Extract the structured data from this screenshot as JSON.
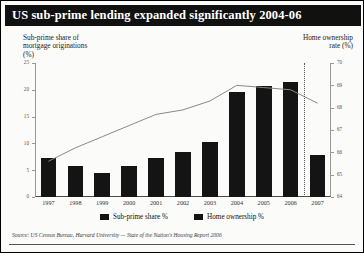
{
  "title": "US sub-prime lending expanded significantly 2004-06",
  "left_axis_caption": "Sub-prime share of\nmortgage originations\n(%)",
  "left_axis_caption_lines": [
    "Sub-prime share of",
    "mortgage originations",
    "(%)"
  ],
  "right_axis_caption_lines": [
    "Home ownership",
    "rate (%)"
  ],
  "legend": [
    {
      "label": "Sub-prime share %",
      "color": "#141414",
      "marker": "swatch"
    },
    {
      "label": "Home ownership %",
      "color": "#141414",
      "marker": "swatch"
    }
  ],
  "source": "Source: US Census Bureau, Harvard University — State of the Nation's Housing Report 2006",
  "forecast_divider_after": "2006",
  "chart_data": {
    "type": "bar",
    "title": "US sub-prime lending expanded significantly 2004-06",
    "subtitle": "",
    "xlabel": "",
    "ylabel": "Sub-prime share of mortgage originations (%)",
    "y2label": "Home ownership rate (%)",
    "categories": [
      "1997",
      "1998",
      "1999",
      "2000",
      "2001",
      "2002",
      "2003",
      "2004",
      "2005",
      "2006",
      "2007"
    ],
    "ylim": [
      0,
      25
    ],
    "yticks": [
      0,
      5,
      10,
      15,
      20,
      25
    ],
    "y2lim": [
      64,
      70
    ],
    "y2ticks": [
      64,
      65,
      66,
      67,
      68,
      69,
      70
    ],
    "grid": false,
    "legend_position": "bottom",
    "series": [
      {
        "name": "Sub-prime share %",
        "type": "bar",
        "axis": "left",
        "color": "#141414",
        "values": [
          7.2,
          5.8,
          4.5,
          5.8,
          7.3,
          8.4,
          10.2,
          19.5,
          20.7,
          21.4,
          7.9
        ]
      },
      {
        "name": "Home ownership %",
        "type": "line",
        "axis": "right",
        "color": "#8a8a84",
        "values": [
          65.6,
          66.2,
          66.7,
          67.2,
          67.7,
          67.9,
          68.3,
          69.0,
          68.9,
          68.8,
          68.2
        ]
      }
    ]
  }
}
